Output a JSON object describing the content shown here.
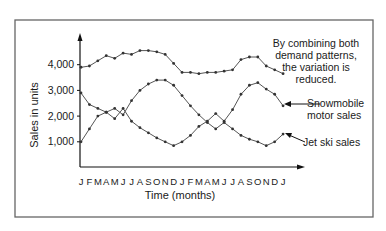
{
  "chart_data": {
    "type": "line",
    "title": "",
    "xlabel": "Time (months)",
    "ylabel": "Sales in units",
    "ylim": [
      0,
      5000
    ],
    "yticks": [
      1000,
      2000,
      3000,
      4000
    ],
    "ytick_labels": [
      "1,000",
      "2,000",
      "3,000",
      "4,000"
    ],
    "categories": [
      "J",
      "F",
      "M",
      "A",
      "M",
      "J",
      "J",
      "A",
      "S",
      "O",
      "N",
      "D",
      "J",
      "F",
      "M",
      "A",
      "M",
      "J",
      "J",
      "A",
      "S",
      "O",
      "N",
      "D",
      "J"
    ],
    "grid": false,
    "legend_position": "inline annotations (right)",
    "series": [
      {
        "name": "Combined demand",
        "values": [
          3900,
          3950,
          4150,
          4350,
          4250,
          4450,
          4400,
          4550,
          4550,
          4500,
          4400,
          4050,
          3700,
          3700,
          3650,
          3700,
          3700,
          3750,
          3800,
          4200,
          4300,
          4300,
          3950,
          3800,
          3650
        ]
      },
      {
        "name": "Snowmobile motor sales",
        "values": [
          2900,
          2450,
          2300,
          2150,
          1900,
          2300,
          1800,
          1550,
          1350,
          1150,
          1000,
          850,
          1000,
          1250,
          1600,
          1800,
          2100,
          1800,
          2250,
          2850,
          3200,
          3300,
          3050,
          2850,
          2400
        ]
      },
      {
        "name": "Jet ski sales",
        "values": [
          1000,
          1500,
          2000,
          2150,
          2300,
          2050,
          2600,
          3000,
          3250,
          3400,
          3400,
          3200,
          2800,
          2400,
          2050,
          1750,
          1500,
          1750,
          1500,
          1250,
          1100,
          1000,
          850,
          1000,
          1300
        ]
      }
    ],
    "annotations": [
      "By combining both demand patterns, the variation is reduced.",
      "Snowmobile motor sales",
      "Jet ski sales"
    ]
  },
  "labels": {
    "ylabel": "Sales in units",
    "xlabel": "Time (months)",
    "note_line1": "By combining both",
    "note_line2": "demand patterns,",
    "note_line3": "the variation is",
    "note_line4": "reduced.",
    "snow_line1": "Snowmobile",
    "snow_line2": "motor sales",
    "jetski": "Jet ski sales"
  },
  "colors": {
    "line": "#555555",
    "marker": "#333333",
    "axis": "#111111",
    "frame": "#666666"
  }
}
